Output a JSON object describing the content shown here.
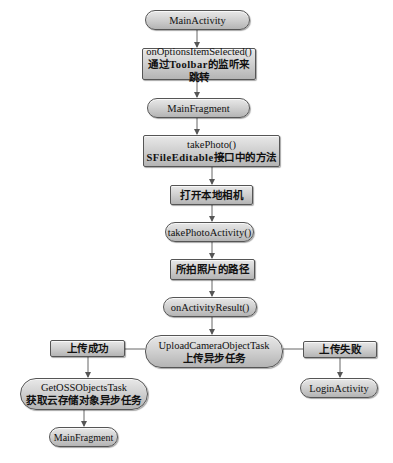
{
  "diagram": {
    "nodes": {
      "main_activity": "MainActivity",
      "on_options_line1": "onOptionsItemSelected()",
      "on_options_line2": "通过Toolbar的监听来跳转",
      "main_fragment": "MainFragment",
      "take_photo_line1": "takePhoto()",
      "take_photo_line2": "SFileEditable接口中的方法",
      "open_camera": "打开本地相机",
      "take_photo_activity": "takePhotoActivity()",
      "photo_path": "所拍照片的路径",
      "on_activity_result": "onActivityResult()",
      "upload_task_line1": "UploadCameraObjectTask",
      "upload_task_line2": "上传异步任务",
      "upload_success": "上传成功",
      "upload_fail": "上传失败",
      "get_oss_line1": "GetOSSObjectsTask",
      "get_oss_line2": "获取云存储对象异步任务",
      "login_activity": "LoginActivity",
      "main_fragment_2": "MainFragment"
    },
    "edges": [
      [
        "MainActivity",
        "onOptionsItemSelected()"
      ],
      [
        "onOptionsItemSelected()",
        "MainFragment"
      ],
      [
        "MainFragment",
        "takePhoto()"
      ],
      [
        "takePhoto()",
        "打开本地相机"
      ],
      [
        "打开本地相机",
        "takePhotoActivity()"
      ],
      [
        "takePhotoActivity()",
        "所拍照片的路径"
      ],
      [
        "所拍照片的路径",
        "onActivityResult()"
      ],
      [
        "onActivityResult()",
        "UploadCameraObjectTask"
      ],
      [
        "UploadCameraObjectTask",
        "上传成功"
      ],
      [
        "UploadCameraObjectTask",
        "上传失败"
      ],
      [
        "上传成功",
        "GetOSSObjectsTask"
      ],
      [
        "上传失败",
        "LoginActivity"
      ],
      [
        "GetOSSObjectsTask",
        "MainFragment"
      ]
    ],
    "colors": {
      "node_light": "#e8e8e8",
      "node_dark": "#b4b4b4",
      "border": "#555555",
      "line": "#555555"
    }
  }
}
